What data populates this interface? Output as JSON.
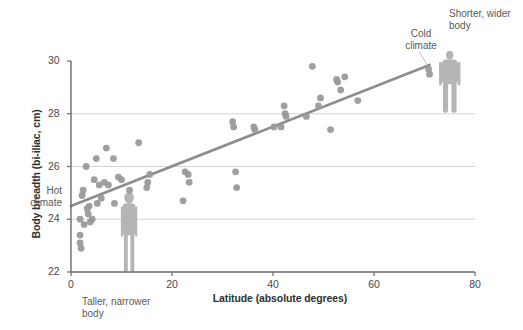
{
  "chart_data": {
    "type": "scatter",
    "title": "",
    "subtitle": "",
    "xlabel": "Latitude (absolute degrees)",
    "ylabel": "Body breadth (bi-iliac, cm)",
    "xlim": [
      0,
      80
    ],
    "ylim": [
      22,
      30
    ],
    "xticks": [
      0,
      20,
      40,
      60,
      80
    ],
    "yticks": [
      22,
      24,
      26,
      28,
      30
    ],
    "xtick_labels": [
      "0",
      "20",
      "40",
      "60",
      "80"
    ],
    "ytick_labels": [
      "22",
      "24",
      "26",
      "28",
      "30"
    ],
    "grid": "horizontal-only",
    "gridlines_y": [
      24,
      26,
      28
    ],
    "legend": "none",
    "point_color": "#9a9a9a",
    "line_color": "#8d8d8d",
    "grid_color": "#c9c9c9",
    "axis_color": "#6b6b6b",
    "series": [
      {
        "name": "Populations",
        "marker": "circle",
        "points": [
          [
            1.8,
            24.0
          ],
          [
            1.8,
            23.4
          ],
          [
            1.8,
            23.1
          ],
          [
            2.0,
            22.9
          ],
          [
            2.2,
            24.9
          ],
          [
            2.4,
            25.1
          ],
          [
            2.6,
            23.8
          ],
          [
            3.0,
            26.0
          ],
          [
            3.2,
            24.4
          ],
          [
            3.4,
            24.2
          ],
          [
            3.6,
            24.5
          ],
          [
            3.8,
            23.9
          ],
          [
            4.2,
            24.0
          ],
          [
            4.6,
            25.5
          ],
          [
            5.0,
            26.3
          ],
          [
            5.2,
            24.6
          ],
          [
            5.6,
            25.3
          ],
          [
            6.0,
            24.8
          ],
          [
            6.6,
            25.4
          ],
          [
            7.0,
            26.7
          ],
          [
            7.4,
            25.3
          ],
          [
            8.4,
            26.3
          ],
          [
            8.6,
            24.6
          ],
          [
            9.4,
            25.6
          ],
          [
            10.0,
            25.5
          ],
          [
            11.6,
            25.1
          ],
          [
            13.4,
            26.9
          ],
          [
            15.0,
            25.2
          ],
          [
            15.2,
            25.4
          ],
          [
            15.6,
            25.7
          ],
          [
            22.2,
            24.7
          ],
          [
            22.6,
            25.8
          ],
          [
            23.2,
            25.7
          ],
          [
            23.4,
            25.4
          ],
          [
            32.0,
            27.7
          ],
          [
            32.2,
            27.5
          ],
          [
            32.6,
            25.8
          ],
          [
            32.8,
            25.2
          ],
          [
            36.2,
            27.5
          ],
          [
            36.4,
            27.4
          ],
          [
            40.2,
            27.5
          ],
          [
            41.6,
            27.5
          ],
          [
            42.2,
            28.3
          ],
          [
            42.4,
            28.0
          ],
          [
            42.6,
            27.9
          ],
          [
            46.6,
            27.9
          ],
          [
            47.8,
            29.8
          ],
          [
            49.0,
            28.3
          ],
          [
            49.4,
            28.6
          ],
          [
            51.4,
            27.4
          ],
          [
            52.6,
            29.3
          ],
          [
            52.8,
            29.2
          ],
          [
            53.4,
            28.9
          ],
          [
            54.2,
            29.4
          ],
          [
            56.8,
            28.5
          ],
          [
            70.8,
            29.7
          ],
          [
            71.0,
            29.5
          ]
        ]
      }
    ],
    "trend_line": {
      "name": "fit",
      "x0": 0,
      "y0": 24.5,
      "x1": 71,
      "y1": 29.85
    },
    "annotations": [
      {
        "name": "hot-climate",
        "text": "Hot\nclimate",
        "x": 0,
        "y": 24.6,
        "position": "left-of-axis"
      },
      {
        "name": "cold-climate",
        "text": "Cold\nclimate",
        "x": 66,
        "y": 30.2,
        "position": "above-line"
      },
      {
        "name": "taller-narrower",
        "text": "Taller, narrower\nbody",
        "x": 8,
        "y": 21.2,
        "position": "below-axis"
      },
      {
        "name": "shorter-wider",
        "text": "Shorter, wider\nbody",
        "x": 78,
        "y": 30.9,
        "position": "top-right"
      }
    ],
    "figures": [
      {
        "name": "tall-narrow-human",
        "x": 11.5,
        "description": "tall narrow human silhouette"
      },
      {
        "name": "short-wide-human",
        "x": 75,
        "description": "shorter wider human silhouette"
      }
    ]
  },
  "axis": {
    "x_title": "Latitude (absolute degrees)",
    "y_title": "Body breadth (bi-iliac, cm)",
    "x_ticks": [
      "0",
      "20",
      "40",
      "60",
      "80"
    ],
    "y_ticks": [
      "22",
      "24",
      "26",
      "28",
      "30"
    ]
  },
  "annotations": {
    "hot_climate_line1": "Hot",
    "hot_climate_line2": "climate",
    "cold_climate_line1": "Cold",
    "cold_climate_line2": "climate",
    "taller_line1": "Taller, narrower",
    "taller_line2": "body",
    "shorter_line1": "Shorter, wider",
    "shorter_line2": "body"
  }
}
